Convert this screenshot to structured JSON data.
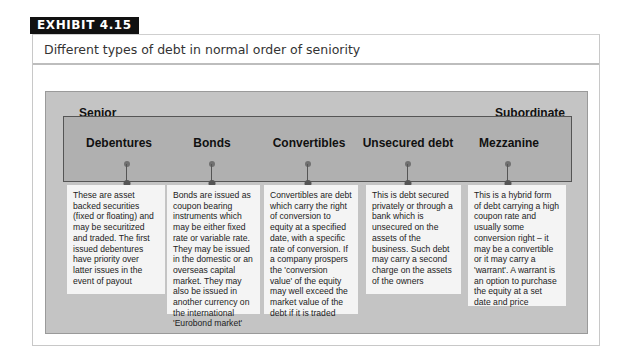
{
  "exhibit": {
    "label": "EXHIBIT 4.15",
    "title": "Different types of debt in normal order of seniority"
  },
  "diagram": {
    "left_label": "Senior",
    "right_label": "Subordinate",
    "colors": {
      "outer_panel": "#c4c4c4",
      "band": "#b0b0b0",
      "band_border": "#555555",
      "box_background": "#f4f4f4",
      "tab_background": "#111111"
    },
    "debt_types": [
      {
        "heading": "Debentures",
        "description": "These are asset backed securities (fixed or floating) and may be securitized and traded. The first issued debentures have priority over latter issues in the event of payout"
      },
      {
        "heading": "Bonds",
        "description": "Bonds are issued as coupon bearing instruments which may be either fixed rate or variable rate. They may be issued in the domestic or an overseas capital market. They may also be issued in another currency on the international 'Eurobond market'"
      },
      {
        "heading": "Convertibles",
        "description": "Convertibles are debt which carry the right of conversion to equity at a specified date, with a specific rate of conversion. If a company prospers the 'conversion value' of the equity may well exceed the market value of the debt if it is traded"
      },
      {
        "heading": "Unsecured debt",
        "description": "This is debt secured privately or through a bank which is unsecured on the assets of the business. Such debt may carry a second charge on the assets of the owners"
      },
      {
        "heading": "Mezzanine",
        "description": "This is a hybrid form of debt carrying a high coupon rate and usually some conversion right – it may be a convertible or it may carry a 'warrant'. A warrant is an option to purchase the equity at a set date and price"
      }
    ]
  }
}
